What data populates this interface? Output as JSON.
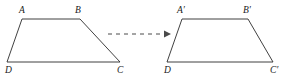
{
  "figure": {
    "canvas": {
      "width": 287,
      "height": 77,
      "background": "#ffffff"
    },
    "stroke_color": "#2b2b2b",
    "label_color": "#1a1a1a",
    "arrow_color": "#4a4a4a",
    "shapes": [
      {
        "id": "preimage",
        "name": "trapezoid-abcd",
        "points": "22,19 80,19 120,62 7,62",
        "vertices": [
          {
            "key": "A",
            "label": "A",
            "x": 22,
            "y": 19,
            "label_x": 19,
            "label_y": 13
          },
          {
            "key": "B",
            "label": "B",
            "x": 80,
            "y": 19,
            "label_x": 75,
            "label_y": 13
          },
          {
            "key": "C",
            "label": "C",
            "x": 120,
            "y": 62,
            "label_x": 117,
            "label_y": 73
          },
          {
            "key": "D",
            "label": "D",
            "x": 7,
            "y": 62,
            "label_x": 5,
            "label_y": 73
          }
        ]
      },
      {
        "id": "image",
        "name": "trapezoid-a-prime-b-prime-c-prime-d-prime",
        "points": "182,19 248,19 273,62 167,62",
        "vertices": [
          {
            "key": "Ap",
            "label": "A′",
            "x": 182,
            "y": 19,
            "label_x": 177,
            "label_y": 13
          },
          {
            "key": "Bp",
            "label": "B′",
            "x": 248,
            "y": 19,
            "label_x": 243,
            "label_y": 13
          },
          {
            "key": "Cp",
            "label": "C′",
            "x": 273,
            "y": 62,
            "label_x": 270,
            "label_y": 73
          },
          {
            "key": "Dp",
            "label": "D",
            "x": 167,
            "y": 62,
            "label_x": 164,
            "label_y": 73
          }
        ]
      }
    ],
    "arrow": {
      "name": "transformation-arrow",
      "style": "dashed-with-arrowhead",
      "x1": 108,
      "y1": 34,
      "x2": 164,
      "y2": 34,
      "head": "164,30.5 171,34 164,37.5"
    }
  }
}
